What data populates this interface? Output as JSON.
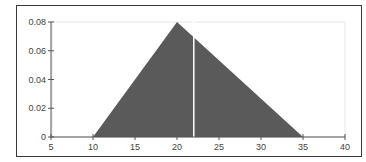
{
  "chart_data": {
    "type": "area",
    "title": "",
    "xlabel": "",
    "ylabel": "",
    "xlim": [
      5,
      40
    ],
    "ylim": [
      0,
      0.08
    ],
    "x_ticks": [
      5,
      10,
      15,
      20,
      25,
      30,
      35,
      40
    ],
    "x_tick_labels": [
      "5",
      "10",
      "15",
      "20",
      "25",
      "30",
      "35",
      "40"
    ],
    "y_ticks": [
      0,
      0.02,
      0.04,
      0.06,
      0.08
    ],
    "y_tick_labels": [
      "0",
      "0.02",
      "0.04",
      "0.06",
      "0.08"
    ],
    "series": [
      {
        "name": "Triangular distribution",
        "x": [
          10,
          20,
          35
        ],
        "y": [
          0,
          0.08,
          0
        ]
      }
    ],
    "distribution": {
      "kind": "triangular",
      "min": 10,
      "mode": 20,
      "max": 35,
      "peak_density": 0.08
    },
    "marker_line_x": 22,
    "grid": false,
    "legend": "none"
  },
  "colors": {
    "fill": "#5a5a5a",
    "axis": "#555555",
    "frame": "#3a3a3a",
    "plot_border": "#e6e6e6",
    "marker_line": "#ffffff",
    "background": "#ffffff"
  }
}
